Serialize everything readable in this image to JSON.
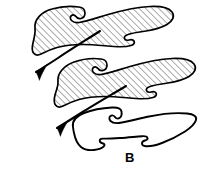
{
  "figure": {
    "label": "B",
    "label_position": {
      "x": 125,
      "y": 151
    },
    "domain_type": "line-drawing",
    "background_color": "#ffffff",
    "ink_color": "#000000",
    "hatch_color": "#2a2a2a",
    "canvas": {
      "width": 205,
      "height": 173
    },
    "hatching": {
      "angle_deg": -45,
      "spacing_px": 3.2,
      "line_width_px": 0.7
    },
    "elements": [
      {
        "name": "upper-element",
        "hatched": true,
        "outline_width_px": 1.6,
        "path": "M 35 28 C 34 20 41 12 52 9 C 62 6 72 6 79 7 C 83 7.5 85 10 85 13 C 85 16 83 18 81 18.5 C 79 19 77 18 76 16.5 C 75 15 73 14.5 71.5 15.5 C 70 16.5 70 19 71.5 20.5 C 73.5 22.5 76 23 79 22.5 C 86 21.5 96 18 108 14.5 C 122 10.5 138 7 150 6.5 C 161 6 169 8 172 12 C 175 16 173 21 167 24.5 C 161 28 153 30 146 31 C 139 32 132 33 128 34.5 C 125 35.5 124 37 124.5 38.5 C 125 40 127 40.5 129 40 C 131 39.5 133 39.5 134 41 C 135 42.5 134 44.5 131 45.5 C 127 46.8 121 47 114 46.5 C 104 45.8 93 44.5 83 44.5 C 73 44.5 64 45.5 57 47.5 C 50 49.5 45 52 41 54 C 38 55.5 35 55 33.5 53 C 32 51 32 47 33 43 C 34.5 37 35.5 32 35 28 Z"
      },
      {
        "name": "middle-element",
        "hatched": true,
        "outline_width_px": 1.6,
        "path": "M 58 82 C 57 74 63 66 74 62 C 84 58.5 94 58 101 59 C 105 59.5 107 62 107 65 C 107 68 105 70 103 70.5 C 101 71 99 70 98 68.5 C 97 67 95 66.5 93.5 67.5 C 92 68.5 92 71 93.5 72.5 C 95.5 74.5 98 75 101 74.5 C 108 73.5 118 70 130 66.5 C 144 62.5 160 59 172 58.5 C 183 58 191 60 194 64 C 197 68 195 73 189 76.5 C 183 80 175 82 168 83 C 161 84 154 85 150 86.5 C 147 87.5 146 89 146.5 90.5 C 147 92 149 92.5 151 92 C 153 91.5 155 91.5 156 93 C 157 94.5 156 96.5 153 97.5 C 149 98.8 143 99 136 98.5 C 126 97.8 115 96.5 105 96.5 C 95 96.5 86 97.5 79 99.5 C 72 101.5 67 104 63 106 C 60 107.5 57 107 55.5 105 C 54 103 54 99 55 95 C 56.5 89 58.5 86 58 82 Z"
      },
      {
        "name": "lower-element",
        "hatched": false,
        "outline_width_px": 1.8,
        "path": "M 73 127 C 72 121 76 116 84 113 C 93 109.5 103 108 112 107.5 C 118 107.2 121 108.5 121.5 111.5 C 122 114.5 121 117 119.5 118 C 118 119 116 118.5 115 117 C 114 115.5 112 115 110.5 116 C 109 117 109 119.5 110.5 121 C 112.5 123 115 123.5 119 123 C 127 122 137 119 149 116.5 C 162 113.8 177 112.5 187 113.5 C 194 114.2 197 116.5 196 120 C 195 123.5 191 127.5 185 131.5 C 178 136 170 140 162 143 C 155 145.6 150 146.5 146 146.2 C 143 146 142 145 142 143.5 C 142 142 143 141 145 140.5 C 147 140 148 139 147.5 137.8 C 147 136.5 145 136 142 136.2 C 136 136.6 128 137.5 120 138 C 113 138.5 107 138.8 103 138.6 C 100.5 138.5 99.5 139.5 99.8 141 C 100 142.5 101.5 143.2 103 143.5 C 104.5 143.8 105 145 104 146.2 C 102.5 148 99 149.5 94 150 C 88.5 150.5 84 149.5 81 147 C 77 143.6 75 138 74 133 C 73.4 130.5 73.2 128.5 73 127 Z"
      }
    ],
    "arrows": [
      {
        "name": "upper-arrow",
        "points_toward": "lower-left",
        "shaft_path": "M 100 31 C 86 40 70 50 58 58 C 48 64.5 41 69 36 72",
        "head_path": "M 36 72 C 40.5 69.5 44.5 66.8 47 64.4 C 45.5 67.6 43.8 70.5 42.4 73.2 C 41 76 40 78.4 39.4 80.4 C 38.6 77.8 37.6 75 36 72 Z"
      },
      {
        "name": "lower-arrow",
        "points_toward": "lower-left",
        "shaft_path": "M 126 86 C 111 95 94 105 81 113 C 70 120 62 125 57 128",
        "head_path": "M 57 128 C 61.5 125.5 65.5 122.8 68 120.4 C 66.5 123.6 64.8 126.5 63.4 129.2 C 62 132 61 134.4 60.4 136.4 C 59.6 133.8 58.6 131 57 128 Z"
      }
    ]
  }
}
